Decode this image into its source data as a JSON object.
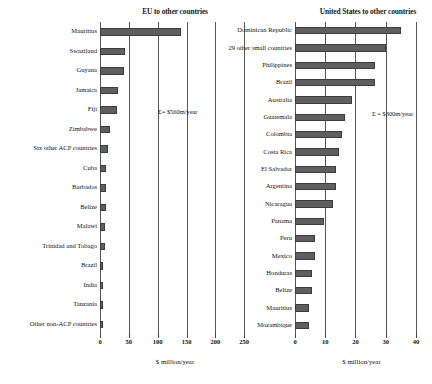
{
  "chart_data": [
    {
      "type": "bar",
      "orientation": "horizontal",
      "title": "EU to other countries",
      "xlabel": "$ million/year",
      "ylabel": "",
      "xlim": [
        0,
        260
      ],
      "xticks": [
        0,
        50,
        100,
        150,
        200,
        250
      ],
      "grid": true,
      "annotation": "Σ= $560m/year",
      "categories": [
        "Mauritius",
        "Swaziland",
        "Guyana",
        "Jamaica",
        "Fiji",
        "Zimbabwe",
        "Six other ACP countries",
        "Cuba",
        "Barbados",
        "Belize",
        "Malawi",
        "Trinidad and Tobago",
        "Brazil",
        "India",
        "Tanzania",
        "Other non-ACP countries"
      ],
      "values": [
        140,
        43,
        41,
        31,
        29,
        17,
        14,
        11,
        10,
        10,
        9,
        8,
        6,
        5,
        5,
        5
      ]
    },
    {
      "type": "bar",
      "orientation": "horizontal",
      "title": "United States to other countries",
      "xlabel": "$ million/year",
      "ylabel": "",
      "xlim": [
        0,
        44
      ],
      "xticks": [
        0,
        10,
        20,
        30,
        40
      ],
      "grid": true,
      "annotation": "Σ = $300m/year",
      "categories": [
        "Dominican Republic",
        "29 other small countries",
        "Philippines",
        "Brazil",
        "Australia",
        "Guatemala",
        "Colombia",
        "Costa Rica",
        "El Salvador",
        "Argentina",
        "Nicaragua",
        "Panama",
        "Peru",
        "Mexico",
        "Honduras",
        "Belize",
        "Mauritius",
        "Mozambique"
      ],
      "values": [
        35,
        30,
        26.5,
        26.5,
        19,
        16.5,
        15.5,
        14.5,
        13.5,
        13.5,
        12.5,
        9.5,
        6.5,
        6.5,
        5.5,
        5.5,
        4.5,
        4.5
      ]
    }
  ]
}
